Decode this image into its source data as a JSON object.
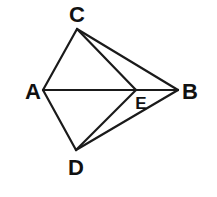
{
  "diagram": {
    "points": {
      "A": {
        "x": 43,
        "y": 90,
        "label": "A",
        "lx": 33,
        "ly": 99,
        "size": 22
      },
      "B": {
        "x": 178,
        "y": 90,
        "label": "B",
        "lx": 190,
        "ly": 99,
        "size": 22
      },
      "C": {
        "x": 77,
        "y": 29,
        "label": "C",
        "lx": 77,
        "ly": 22,
        "size": 22
      },
      "D": {
        "x": 76,
        "y": 150,
        "label": "D",
        "lx": 76,
        "ly": 175,
        "size": 22
      },
      "E": {
        "x": 136,
        "y": 90,
        "label": "E",
        "lx": 141,
        "ly": 109,
        "size": 17
      }
    },
    "segments": [
      [
        "A",
        "C"
      ],
      [
        "C",
        "E"
      ],
      [
        "C",
        "B"
      ],
      [
        "A",
        "B"
      ],
      [
        "A",
        "D"
      ],
      [
        "D",
        "E"
      ],
      [
        "D",
        "B"
      ]
    ],
    "stroke": "#1a1a1a"
  }
}
